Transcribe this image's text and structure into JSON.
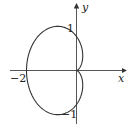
{
  "diagram": {
    "type": "polar-curve",
    "curve": "cardioid r = 1 - cos(theta)",
    "axes": {
      "x_label": "x",
      "y_label": "y"
    },
    "tick_labels": {
      "y_pos": "1",
      "y_neg": "−1",
      "x_neg": "−2"
    },
    "colors": {
      "stroke": "#333333",
      "background": "#ffffff"
    }
  }
}
